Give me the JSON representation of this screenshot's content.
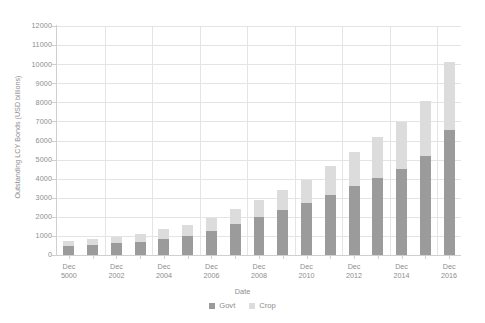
{
  "chart_data": {
    "type": "bar",
    "subtype": "stacked-bar",
    "title": "",
    "xlabel": "Date",
    "ylabel": "Outstanding LCY Bonds (USD billions)",
    "ylim": [
      0,
      12000
    ],
    "ytick_values": [
      0,
      1000,
      2000,
      3000,
      4000,
      5000,
      6000,
      7000,
      8000,
      9000,
      10000,
      11000,
      12000
    ],
    "ytick_labels": [
      "0",
      "1000",
      "2000",
      "3000",
      "4000",
      "5000",
      "6000",
      "7000",
      "8000",
      "9000",
      "10000",
      "11000",
      "12000"
    ],
    "grid": true,
    "grid_axis": "both",
    "legend_position": "bottom-center",
    "categories": [
      "Dec 5000",
      "Dec 2001",
      "Dec 2002",
      "Dec 2003",
      "Dec 2004",
      "Dec 2005",
      "Dec 2006",
      "Dec 2007",
      "Dec 2008",
      "Dec 2009",
      "Dec 2010",
      "Dec 2011",
      "Dec 2012",
      "Dec 2013",
      "Dec 2014",
      "Dec 2015",
      "Dec 2016"
    ],
    "xtick_labels": [
      {
        "line1": "Dec",
        "line2": "5000",
        "index": 0
      },
      {
        "line1": "Dec",
        "line2": "2002",
        "index": 2
      },
      {
        "line1": "Dec",
        "line2": "2004",
        "index": 4
      },
      {
        "line1": "Dec",
        "line2": "2006",
        "index": 6
      },
      {
        "line1": "Dec",
        "line2": "2008",
        "index": 8
      },
      {
        "line1": "Dec",
        "line2": "2010",
        "index": 10
      },
      {
        "line1": "Dec",
        "line2": "2012",
        "index": 12
      },
      {
        "line1": "Dec",
        "line2": "2014",
        "index": 14
      },
      {
        "line1": "Dec",
        "line2": "2016",
        "index": 16
      }
    ],
    "series": [
      {
        "name": "Govt",
        "color": "#9b9b9b",
        "values": [
          480,
          530,
          620,
          700,
          840,
          1000,
          1250,
          1600,
          2000,
          2350,
          2700,
          3150,
          3600,
          4050,
          4500,
          5200,
          6550
        ]
      },
      {
        "name": "Crop",
        "color": "#dcdcdc",
        "values": [
          250,
          290,
          330,
          400,
          500,
          580,
          700,
          800,
          900,
          1050,
          1250,
          1500,
          1800,
          2150,
          2450,
          2850,
          3550
        ]
      }
    ],
    "totals": [
      730,
      820,
      950,
      1100,
      1340,
      1580,
      1950,
      2400,
      2900,
      3400,
      3950,
      4650,
      5400,
      6200,
      6950,
      8050,
      10100
    ]
  },
  "legend": {
    "items": [
      {
        "label": "Govt",
        "color": "#9b9b9b"
      },
      {
        "label": "Crop",
        "color": "#dcdcdc"
      }
    ]
  },
  "colors": {
    "govt": "#9b9b9b",
    "crop": "#dcdcdc",
    "grid": "#e4e4e4",
    "axis": "#cfcfcf",
    "text": "#8d8d8d",
    "background": "#ffffff"
  }
}
